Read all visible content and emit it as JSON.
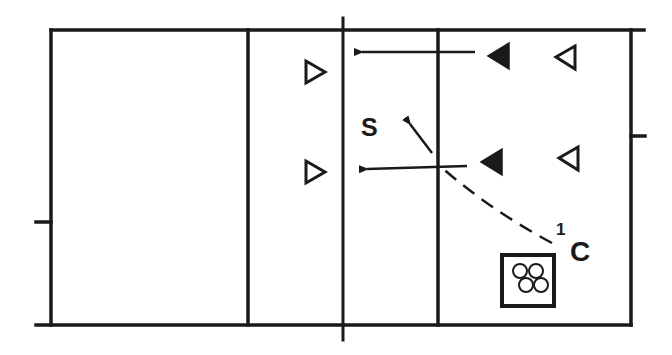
{
  "diagram": {
    "type": "volleyball-court-play-diagram",
    "colors": {
      "line": "#1a1a1a",
      "background": "#ffffff"
    },
    "labels": {
      "setter": "S",
      "coach": "C",
      "coach_superscript": "1"
    },
    "court": {
      "outer": {
        "left": 51,
        "top": 30,
        "right": 631,
        "bottom": 325
      },
      "verticals": [
        248,
        343,
        438
      ],
      "net_x": 343
    },
    "players": [
      {
        "id": "left-top-open",
        "kind": "open-triangle",
        "facing": "right",
        "x": 316,
        "y": 72
      },
      {
        "id": "left-bottom-open",
        "kind": "open-triangle",
        "facing": "right",
        "x": 316,
        "y": 172
      },
      {
        "id": "right-front-top-filled",
        "kind": "filled-triangle",
        "facing": "left",
        "x": 500,
        "y": 56
      },
      {
        "id": "right-front-bottom-filled",
        "kind": "filled-triangle",
        "facing": "left",
        "x": 492,
        "y": 161
      },
      {
        "id": "right-back-top-open",
        "kind": "open-triangle",
        "facing": "left",
        "x": 567,
        "y": 57
      },
      {
        "id": "right-back-bottom-open",
        "kind": "open-triangle",
        "facing": "left",
        "x": 570,
        "y": 158
      }
    ],
    "arrows": [
      {
        "id": "top-attack-arrow",
        "from": [
          475,
          52
        ],
        "to": [
          357,
          52
        ]
      },
      {
        "id": "bottom-attack-arrow",
        "from": [
          467,
          166
        ],
        "to": [
          362,
          169
        ]
      },
      {
        "id": "set-arrow",
        "from": [
          432,
          153
        ],
        "to": [
          406,
          120
        ]
      }
    ],
    "dashed_path": {
      "id": "coach-toss-path",
      "from": [
        552,
        243
      ],
      "to": [
        440,
        166
      ]
    },
    "ball_cart": {
      "id": "ball-cart",
      "x": 501,
      "y": 254,
      "w": 54,
      "h": 53,
      "ball_count": 4
    }
  }
}
